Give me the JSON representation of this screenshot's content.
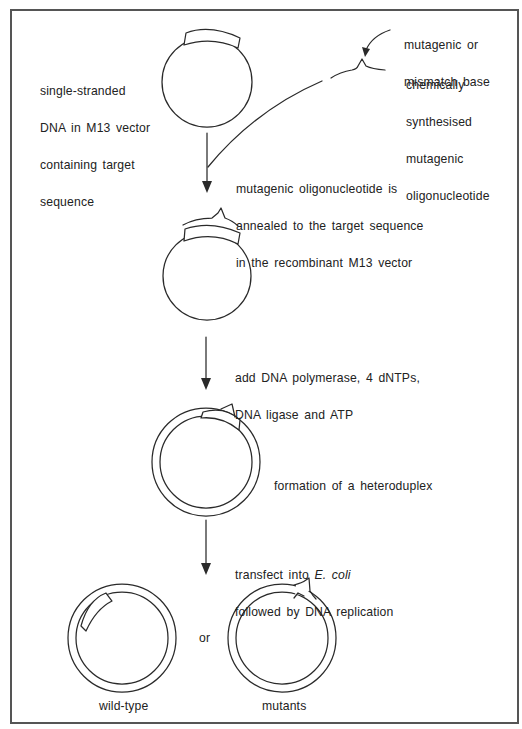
{
  "figure": {
    "frame_color": "#555555",
    "line_color": "#2a2a2a",
    "background": "#ffffff"
  },
  "labels": {
    "mismatch_base": [
      "mutagenic or",
      "mismatch base"
    ],
    "synthetic_oligo": [
      "chemically",
      "synthesised",
      "mutagenic",
      "oligonucleotide"
    ],
    "ssdna_vector": [
      "single-stranded",
      "DNA in M13 vector",
      "containing target",
      "sequence"
    ],
    "step1": [
      "mutagenic oligonucleotide is",
      "annealed to the target sequence",
      "in the recombinant M13 vector"
    ],
    "step2": [
      "add DNA polymerase, 4 dNTPs,",
      "DNA ligase and ATP"
    ],
    "step3": [
      "formation of a heteroduplex"
    ],
    "step4_line1_prefix": "transfect into ",
    "step4_line1_italic": "E. coli",
    "step4_line2": "followed by DNA replication",
    "or": "or",
    "wild_type": "wild-type",
    "mutants": "mutants"
  },
  "diagram": {
    "nodes": [
      {
        "id": "ss-vector",
        "type": "circle-single-strand",
        "center": [
          207,
          82
        ],
        "radius": 45,
        "feature": "target-sequence-patch"
      },
      {
        "id": "oligo",
        "type": "oligonucleotide",
        "feature": "mismatch-kink"
      },
      {
        "id": "annealed",
        "type": "circle-single-strand",
        "center": [
          207,
          276
        ],
        "radius": 44,
        "feature": "annealed-oligo-with-kink"
      },
      {
        "id": "heteroduplex",
        "type": "circle-double-strand",
        "center": [
          206,
          462
        ],
        "outer_radius": 54,
        "inner_radius": 46
      },
      {
        "id": "wild-type",
        "type": "circle-double-strand",
        "center": [
          122,
          638
        ],
        "outer_radius": 54,
        "inner_radius": 46
      },
      {
        "id": "mutant",
        "type": "circle-double-strand",
        "center": [
          282,
          638
        ],
        "outer_radius": 54,
        "inner_radius": 46
      }
    ],
    "edges": [
      {
        "from": "ss-vector",
        "to": "annealed",
        "label": "step1"
      },
      {
        "from": "oligo",
        "to": "annealed",
        "label": "step1"
      },
      {
        "from": "annealed",
        "to": "heteroduplex",
        "label": "step2"
      },
      {
        "from": "heteroduplex",
        "to": "wild-type",
        "label": "step4"
      },
      {
        "from": "heteroduplex",
        "to": "mutant",
        "label": "step4"
      }
    ]
  }
}
